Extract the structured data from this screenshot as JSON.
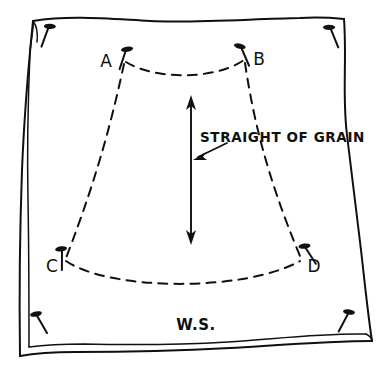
{
  "diagram": {
    "background_color": "#ffffff",
    "ink_color": "#101010",
    "labels": {
      "corner_a": "A",
      "corner_b": "B",
      "corner_c": "C",
      "corner_d": "D",
      "grain": "STRAIGHT OF GRAIN",
      "wrong_side": "W.S."
    },
    "icons": {
      "pin": "sewing-pin-icon",
      "arrow_double": "double-headed-arrow-icon",
      "leader": "leader-arrow-icon"
    },
    "corner_pins": [
      {
        "name": "pin-top-left",
        "x": 49,
        "y": 26,
        "angle": 20
      },
      {
        "name": "pin-top-right",
        "x": 330,
        "y": 27,
        "angle": -22
      },
      {
        "name": "pin-bottom-left",
        "x": 36,
        "y": 314,
        "angle": -30
      },
      {
        "name": "pin-bottom-right",
        "x": 349,
        "y": 312,
        "angle": 28
      }
    ],
    "pattern_pins": [
      {
        "name": "pin-point-a",
        "x": 124,
        "y": 50,
        "angle": 12
      },
      {
        "name": "pin-point-b",
        "x": 243,
        "y": 48,
        "angle": -15
      },
      {
        "name": "pin-point-c",
        "x": 62,
        "y": 250,
        "angle": 8
      },
      {
        "name": "pin-point-d",
        "x": 303,
        "y": 248,
        "angle": -35
      }
    ],
    "pattern_corners": [
      {
        "label": "A",
        "x": 124,
        "y": 62
      },
      {
        "label": "B",
        "x": 246,
        "y": 60
      },
      {
        "label": "C",
        "x": 64,
        "y": 264
      },
      {
        "label": "D",
        "x": 300,
        "y": 262
      }
    ],
    "grain_arrow": {
      "x": 191,
      "top_y": 96,
      "bottom_y": 243,
      "double_headed": true
    }
  }
}
